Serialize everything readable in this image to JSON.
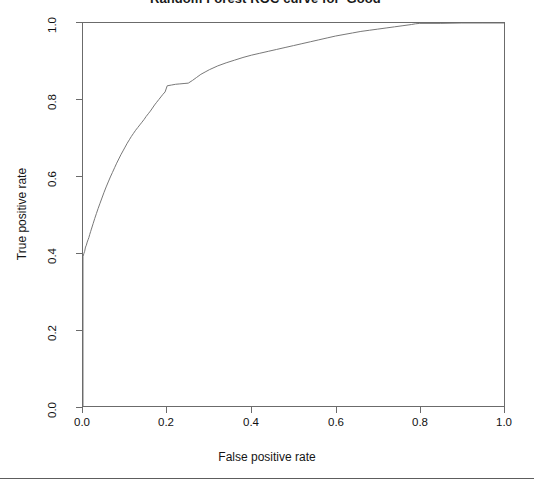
{
  "chart_data": {
    "type": "line",
    "title": "Random Forest ROC curve for 'Good'",
    "xlabel": "False positive rate",
    "ylabel": "True positive rate",
    "xlim": [
      0.0,
      1.0
    ],
    "ylim": [
      0.0,
      1.0
    ],
    "grid": false,
    "legend": null,
    "line_color": "#777777",
    "x_ticks": [
      "0.0",
      "0.2",
      "0.4",
      "0.6",
      "0.8",
      "1.0"
    ],
    "y_ticks": [
      "0.0",
      "0.2",
      "0.4",
      "0.6",
      "0.8",
      "1.0"
    ],
    "x_tick_values": [
      0.0,
      0.2,
      0.4,
      0.6,
      0.8,
      1.0
    ],
    "y_tick_values": [
      0.0,
      0.2,
      0.4,
      0.6,
      0.8,
      1.0
    ],
    "series": [
      {
        "name": "ROC curve",
        "x": [
          0.0,
          0.0,
          0.002,
          0.004,
          0.005,
          0.006,
          0.008,
          0.01,
          0.012,
          0.014,
          0.016,
          0.018,
          0.02,
          0.024,
          0.028,
          0.032,
          0.036,
          0.04,
          0.045,
          0.05,
          0.055,
          0.06,
          0.065,
          0.07,
          0.075,
          0.08,
          0.085,
          0.09,
          0.095,
          0.1,
          0.105,
          0.11,
          0.115,
          0.12,
          0.125,
          0.13,
          0.135,
          0.14,
          0.145,
          0.15,
          0.155,
          0.16,
          0.165,
          0.17,
          0.175,
          0.18,
          0.185,
          0.19,
          0.195,
          0.2,
          0.21,
          0.22,
          0.23,
          0.24,
          0.25,
          0.26,
          0.27,
          0.28,
          0.29,
          0.3,
          0.32,
          0.34,
          0.36,
          0.38,
          0.4,
          0.42,
          0.44,
          0.46,
          0.48,
          0.5,
          0.52,
          0.54,
          0.56,
          0.58,
          0.6,
          0.62,
          0.64,
          0.66,
          0.68,
          0.7,
          0.72,
          0.74,
          0.76,
          0.78,
          0.79,
          0.8,
          0.85,
          0.9,
          0.95,
          1.0
        ],
        "y": [
          0.0,
          0.39,
          0.398,
          0.404,
          0.41,
          0.415,
          0.42,
          0.428,
          0.434,
          0.44,
          0.448,
          0.455,
          0.462,
          0.476,
          0.49,
          0.503,
          0.516,
          0.528,
          0.543,
          0.558,
          0.572,
          0.585,
          0.598,
          0.61,
          0.622,
          0.634,
          0.645,
          0.656,
          0.666,
          0.676,
          0.686,
          0.695,
          0.704,
          0.712,
          0.72,
          0.727,
          0.734,
          0.741,
          0.748,
          0.756,
          0.763,
          0.77,
          0.778,
          0.786,
          0.793,
          0.8,
          0.807,
          0.814,
          0.82,
          0.836,
          0.838,
          0.84,
          0.841,
          0.842,
          0.843,
          0.85,
          0.858,
          0.866,
          0.872,
          0.878,
          0.888,
          0.896,
          0.903,
          0.91,
          0.916,
          0.921,
          0.926,
          0.931,
          0.936,
          0.941,
          0.946,
          0.951,
          0.956,
          0.961,
          0.966,
          0.97,
          0.974,
          0.978,
          0.981,
          0.984,
          0.987,
          0.99,
          0.993,
          0.996,
          0.998,
          0.999,
          0.999,
          1.0,
          1.0,
          1.0
        ]
      }
    ]
  }
}
